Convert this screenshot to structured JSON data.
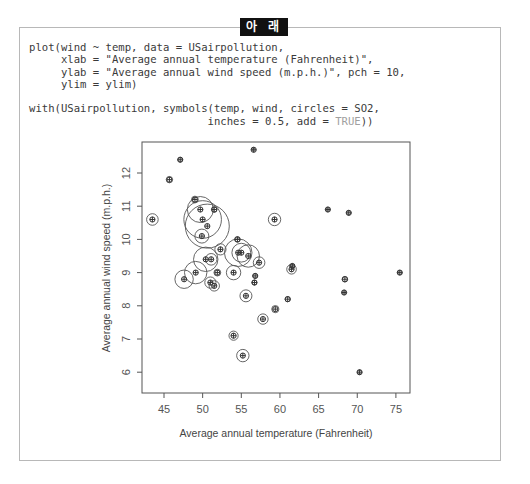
{
  "header": {
    "badge_label": "아 래"
  },
  "code": {
    "lines": [
      "plot(wind ~ temp, data = USairpollution,",
      "     xlab = \"Average annual temperature (Fahrenheit)\",",
      "     ylab = \"Average annual wind speed (m.p.h.)\", pch = 10,",
      "     ylim = ylim)",
      "",
      "with(USairpollution, symbols(temp, wind, circles = SO2,",
      "                            inches = 0.5, add = "
    ],
    "last_line_token": "TRUE",
    "last_line_suffix": "))"
  },
  "colors": {
    "frame": "#b8b8b8",
    "badge_bg": "#111111",
    "point": "#333333",
    "circle": "#555555"
  },
  "chart_data": {
    "type": "scatter",
    "title": "",
    "xlabel": "Average annual temperature (Fahrenheit)",
    "ylabel": "Average annual wind speed (m.p.h.)",
    "xlim": [
      42.6,
      76.5
    ],
    "ylim": [
      5.3,
      13.0
    ],
    "xticks": [
      45,
      50,
      55,
      60,
      65,
      70,
      75
    ],
    "yticks": [
      6,
      7,
      8,
      9,
      10,
      11,
      12
    ],
    "grid": false,
    "legend": null,
    "bubble_size_variable": "SO2",
    "bubble_max_inches": 0.5,
    "points": [
      {
        "temp": 47.6,
        "wind": 8.8,
        "SO2": 46
      },
      {
        "temp": 56.8,
        "wind": 8.9,
        "SO2": 11
      },
      {
        "temp": 61.5,
        "wind": 9.1,
        "SO2": 24
      },
      {
        "temp": 55.0,
        "wind": 9.6,
        "SO2": 47
      },
      {
        "temp": 47.1,
        "wind": 12.4,
        "SO2": 11
      },
      {
        "temp": 55.2,
        "wind": 6.5,
        "SO2": 31
      },
      {
        "temp": 50.6,
        "wind": 10.4,
        "SO2": 110
      },
      {
        "temp": 54.0,
        "wind": 7.1,
        "SO2": 23
      },
      {
        "temp": 49.7,
        "wind": 10.9,
        "SO2": 65
      },
      {
        "temp": 51.5,
        "wind": 8.6,
        "SO2": 26
      },
      {
        "temp": 66.2,
        "wind": 10.9,
        "SO2": 9
      },
      {
        "temp": 51.9,
        "wind": 9.0,
        "SO2": 17
      },
      {
        "temp": 49.0,
        "wind": 11.2,
        "SO2": 17
      },
      {
        "temp": 49.9,
        "wind": 10.1,
        "SO2": 35
      },
      {
        "temp": 49.1,
        "wind": 9.0,
        "SO2": 56
      },
      {
        "temp": 68.9,
        "wind": 10.8,
        "SO2": 10
      },
      {
        "temp": 52.3,
        "wind": 9.7,
        "SO2": 28
      },
      {
        "temp": 68.4,
        "wind": 8.8,
        "SO2": 14
      },
      {
        "temp": 54.5,
        "wind": 10.0,
        "SO2": 14
      },
      {
        "temp": 61.0,
        "wind": 8.2,
        "SO2": 13
      },
      {
        "temp": 55.6,
        "wind": 8.3,
        "SO2": 30
      },
      {
        "temp": 61.6,
        "wind": 9.2,
        "SO2": 10
      },
      {
        "temp": 75.5,
        "wind": 9.0,
        "SO2": 10
      },
      {
        "temp": 45.7,
        "wind": 11.8,
        "SO2": 16
      },
      {
        "temp": 43.5,
        "wind": 10.6,
        "SO2": 29
      },
      {
        "temp": 59.4,
        "wind": 7.9,
        "SO2": 18
      },
      {
        "temp": 68.3,
        "wind": 8.4,
        "SO2": 9
      },
      {
        "temp": 59.3,
        "wind": 10.6,
        "SO2": 31
      },
      {
        "temp": 51.5,
        "wind": 10.9,
        "SO2": 14
      },
      {
        "temp": 54.6,
        "wind": 9.6,
        "SO2": 69
      },
      {
        "temp": 70.3,
        "wind": 6.0,
        "SO2": 10
      },
      {
        "temp": 50.4,
        "wind": 9.4,
        "SO2": 61
      },
      {
        "temp": 50.0,
        "wind": 10.6,
        "SO2": 94
      },
      {
        "temp": 57.8,
        "wind": 7.6,
        "SO2": 26
      },
      {
        "temp": 51.0,
        "wind": 8.7,
        "SO2": 28
      },
      {
        "temp": 56.7,
        "wind": 8.7,
        "SO2": 12
      },
      {
        "temp": 51.1,
        "wind": 9.4,
        "SO2": 29
      },
      {
        "temp": 55.9,
        "wind": 9.5,
        "SO2": 56
      },
      {
        "temp": 57.3,
        "wind": 9.3,
        "SO2": 29
      },
      {
        "temp": 56.6,
        "wind": 12.7,
        "SO2": 8
      },
      {
        "temp": 54.0,
        "wind": 9.0,
        "SO2": 36
      }
    ]
  }
}
